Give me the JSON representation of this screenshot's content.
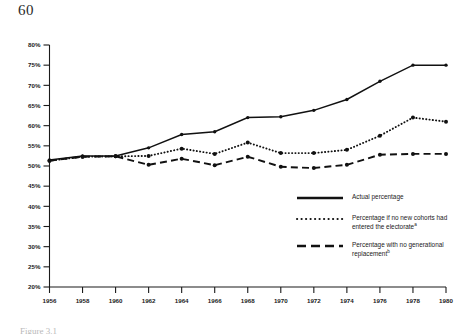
{
  "page": {
    "number": "60"
  },
  "caption": {
    "text": "Figure 3.1"
  },
  "legend": {
    "items": [
      {
        "style": "solid",
        "label": "Actual percentage",
        "note": ""
      },
      {
        "style": "dotted",
        "label": "Percentage if no new cohorts had entered the electorate",
        "note": "a"
      },
      {
        "style": "dashed",
        "label": "Percentage with no generational replacement",
        "note": "b"
      }
    ]
  },
  "axes": {
    "y_ticks": [
      "80%",
      "75%",
      "70%",
      "65%",
      "60%",
      "55%",
      "50%",
      "45%",
      "40%",
      "35%",
      "30%",
      "25%",
      "20%"
    ],
    "x_ticks": [
      "1956",
      "1958",
      "1960",
      "1962",
      "1964",
      "1966",
      "1968",
      "1970",
      "1972",
      "1974",
      "1976",
      "1978",
      "1980"
    ]
  },
  "chart_data": {
    "type": "line",
    "title": "",
    "subtitle": "",
    "xlabel": "",
    "ylabel": "",
    "xlim": [
      1956,
      1980
    ],
    "ylim": [
      20,
      80
    ],
    "y_tick_step": 5,
    "x_tick_step": 2,
    "grid": false,
    "legend_position": "center-right",
    "x": [
      1956,
      1958,
      1960,
      1962,
      1964,
      1966,
      1968,
      1970,
      1972,
      1974,
      1976,
      1978,
      1980
    ],
    "categories": [
      "1956",
      "1958",
      "1960",
      "1962",
      "1964",
      "1966",
      "1968",
      "1970",
      "1972",
      "1974",
      "1976",
      "1978",
      "1980"
    ],
    "series": [
      {
        "name": "Actual percentage",
        "style": "solid",
        "marker": "dot",
        "color": "#111111",
        "values": [
          51.5,
          52.5,
          52.5,
          54.5,
          57.8,
          58.5,
          62.0,
          62.2,
          63.8,
          66.5,
          71.0,
          75.0,
          75.0
        ]
      },
      {
        "name": "Percentage if no new cohorts had entered the electorate",
        "style": "dotted",
        "marker": "dot",
        "color": "#111111",
        "values": [
          51.3,
          52.3,
          52.4,
          52.5,
          54.3,
          53.0,
          55.8,
          53.2,
          53.2,
          54.0,
          57.5,
          62.0,
          61.0
        ]
      },
      {
        "name": "Percentage with no generational replacement",
        "style": "dashed",
        "marker": "dot",
        "color": "#111111",
        "values": [
          51.3,
          52.3,
          52.4,
          50.3,
          51.8,
          50.2,
          52.3,
          49.8,
          49.5,
          50.3,
          52.8,
          53.0,
          53.0
        ]
      }
    ]
  }
}
